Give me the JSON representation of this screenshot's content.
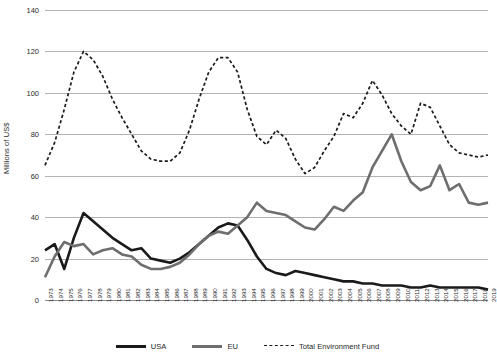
{
  "chart_data": {
    "type": "line",
    "title": "",
    "xlabel": "",
    "ylabel": "Millions of US$",
    "ylim": [
      0,
      140
    ],
    "yticks": [
      0,
      20,
      40,
      60,
      80,
      100,
      120,
      140
    ],
    "grid": true,
    "legend_position": "bottom",
    "categories": [
      "1973",
      "1974",
      "1975",
      "1976",
      "1977",
      "1978",
      "1979",
      "1980",
      "1981",
      "1982",
      "1983",
      "1984",
      "1985",
      "1986",
      "1987",
      "1988",
      "1989",
      "1990",
      "1991",
      "1992",
      "1993",
      "1994",
      "1995",
      "1996",
      "1997",
      "1998",
      "1999",
      "2000",
      "2001",
      "2002",
      "2003",
      "2004",
      "2005",
      "2006",
      "2007",
      "2008",
      "2009",
      "2010",
      "2011",
      "2012",
      "2013",
      "2014",
      "2015",
      "2016",
      "2017",
      "2018",
      "2019"
    ],
    "series": [
      {
        "name": "USA",
        "color": "#1a1a1a",
        "style": "solid",
        "values": [
          24,
          27,
          15,
          30,
          42,
          38,
          34,
          30,
          27,
          24,
          25,
          20,
          19,
          18,
          20,
          23,
          27,
          31,
          35,
          37,
          36,
          29,
          21,
          15,
          13,
          12,
          14,
          13,
          12,
          11,
          10,
          9,
          9,
          8,
          8,
          7,
          7,
          7,
          6,
          6,
          7,
          6,
          6,
          6,
          6,
          6,
          5
        ]
      },
      {
        "name": "EU",
        "color": "#6e6e6e",
        "style": "solid",
        "values": [
          11,
          21,
          28,
          26,
          27,
          22,
          24,
          25,
          22,
          21,
          17,
          15,
          15,
          16,
          18,
          22,
          27,
          31,
          33,
          32,
          36,
          40,
          47,
          43,
          42,
          41,
          38,
          35,
          34,
          39,
          45,
          43,
          48,
          52,
          64,
          72,
          80,
          67,
          57,
          53,
          55,
          65,
          53,
          56,
          47,
          46,
          47
        ]
      },
      {
        "name": "Total Environment Fund",
        "color": "#1a1a1a",
        "style": "dashed",
        "values": [
          65,
          76,
          92,
          110,
          120,
          116,
          108,
          97,
          88,
          80,
          72,
          68,
          67,
          67,
          71,
          82,
          97,
          110,
          117,
          117,
          110,
          92,
          79,
          75,
          82,
          78,
          68,
          61,
          64,
          72,
          79,
          90,
          88,
          95,
          106,
          99,
          90,
          84,
          80,
          95,
          93,
          84,
          75,
          71,
          70,
          69,
          70
        ]
      }
    ]
  },
  "legend": {
    "items": [
      {
        "label": "USA"
      },
      {
        "label": "EU"
      },
      {
        "label": "Total Environment Fund"
      }
    ]
  },
  "axis": {
    "y_title": "Millions of US$"
  }
}
